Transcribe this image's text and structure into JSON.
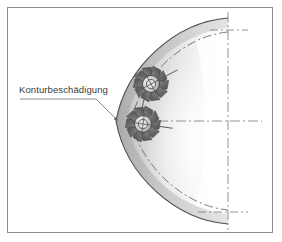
{
  "figure": {
    "width": 282,
    "height": 242,
    "background_color": "#ffffff",
    "frame": {
      "border_color": "#8d8d8d",
      "fill_color": "#ffffff",
      "inset_px": 7
    }
  },
  "annotations": [
    {
      "id": "contour-damage",
      "label": "Konturbeschädigung",
      "text_color": "#3b3b3b",
      "leader_color": "#6f6f6f",
      "text_x": 19,
      "text_y": 84,
      "leader_start_x": 20,
      "leader_start_y": 99,
      "leader_elbow_x": 96,
      "leader_elbow_y": 99,
      "arrow_x": 118,
      "arrow_y": 121
    }
  ],
  "workpiece": {
    "name": "spherical-dome-section",
    "edge_color": "#4a4a4a",
    "fill_light": "#ffffff",
    "fill_mid": "#d8d8d8",
    "fill_dark": "#a8a8a8",
    "outer_arc": {
      "top_x": 228,
      "top_y": 18,
      "bottom_x": 228,
      "bottom_y": 224,
      "leftmost_x": 116,
      "leftmost_y": 121
    },
    "inner_arc": {
      "style": "dash-dot",
      "color": "#5e5e5e",
      "top_x": 228,
      "top_y": 32,
      "bottom_x": 228,
      "bottom_y": 210,
      "leftmost_x": 131,
      "leftmost_y": 121
    }
  },
  "centerlines": {
    "style": "dash-dot",
    "color": "#7a7a7a",
    "horizontal": {
      "x1": 140,
      "y1": 121,
      "x2": 262,
      "y2": 121
    },
    "vertical": {
      "x1": 228,
      "y1": 12,
      "x2": 228,
      "y2": 230
    },
    "cross_top": {
      "x": 228,
      "y": 30
    },
    "cross_bottom": {
      "x": 228,
      "y": 212
    }
  },
  "tools": [
    {
      "id": "milling-cutter-upper",
      "name": "milling-cutter-upper",
      "center_x": 151,
      "center_y": 84,
      "radius": 17,
      "teeth": 10,
      "rotation_deg": -28,
      "body_color": "#6d6d6d",
      "hub_color": "#c9c9c9",
      "axis_color": "#5a5a5a",
      "axis_length": 30
    },
    {
      "id": "milling-cutter-lower",
      "name": "milling-cutter-lower",
      "center_x": 143,
      "center_y": 124,
      "radius": 17,
      "teeth": 10,
      "rotation_deg": 8,
      "body_color": "#6d6d6d",
      "hub_color": "#c9c9c9",
      "axis_color": "#5a5a5a",
      "axis_length": 30
    }
  ],
  "tool_path": {
    "name": "tool-step-path",
    "color": "#5a5a5a",
    "from_x": 143,
    "from_y": 124,
    "to_x": 151,
    "to_y": 84
  }
}
